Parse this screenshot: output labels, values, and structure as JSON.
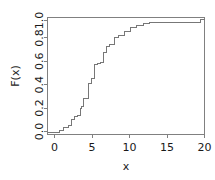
{
  "chart_data": {
    "type": "line",
    "subtype": "ecdf-step",
    "title": "",
    "xlabel": "x",
    "ylabel": "F(x)",
    "xlim": [
      -0.6,
      20.6
    ],
    "ylim": [
      -0.02,
      1.02
    ],
    "xticks": [
      0,
      5,
      10,
      15,
      20
    ],
    "xticklabels": [
      "0",
      "5",
      "10",
      "15",
      "20"
    ],
    "yticks": [
      0.0,
      0.2,
      0.4,
      0.6,
      0.8,
      1.0
    ],
    "yticklabels": [
      "0.0",
      "0.2",
      "0.4",
      "0.6",
      "0.8",
      "1.0"
    ],
    "grid": false,
    "legend": null,
    "line_color": "#777777",
    "axis_color": "#808080",
    "text_color": "#1a1a1a",
    "background": "#ffffff",
    "box_frame": true,
    "x": [
      0.0,
      1.0,
      1.6,
      2.2,
      2.6,
      3.0,
      3.4,
      3.8,
      4.0,
      4.3,
      4.9,
      5.3,
      5.7,
      6.1,
      6.5,
      6.9,
      7.3,
      7.8,
      8.4,
      9.0,
      9.8,
      10.6,
      11.4,
      12.3,
      13.2,
      20.0
    ],
    "y": [
      0.0,
      0.02,
      0.04,
      0.06,
      0.11,
      0.14,
      0.15,
      0.21,
      0.23,
      0.3,
      0.43,
      0.48,
      0.6,
      0.61,
      0.62,
      0.71,
      0.76,
      0.78,
      0.84,
      0.86,
      0.9,
      0.93,
      0.95,
      0.97,
      0.98,
      1.0
    ],
    "series": [
      {
        "name": "F(x)",
        "x": [
          0.0,
          1.0,
          1.6,
          2.2,
          2.6,
          3.0,
          3.4,
          3.8,
          4.0,
          4.3,
          4.9,
          5.3,
          5.7,
          6.1,
          6.5,
          6.9,
          7.3,
          7.8,
          8.4,
          9.0,
          9.8,
          10.6,
          11.4,
          12.3,
          13.2,
          20.0
        ],
        "y": [
          0.0,
          0.02,
          0.04,
          0.06,
          0.11,
          0.14,
          0.15,
          0.21,
          0.23,
          0.3,
          0.43,
          0.48,
          0.6,
          0.61,
          0.62,
          0.71,
          0.76,
          0.78,
          0.84,
          0.86,
          0.9,
          0.93,
          0.95,
          0.97,
          0.98,
          1.0
        ]
      }
    ]
  },
  "axes": {
    "x_title": "x",
    "y_title": "F(x)"
  }
}
